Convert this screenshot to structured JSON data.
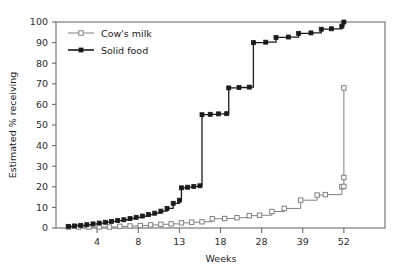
{
  "chart_data": {
    "type": "line",
    "title": "",
    "subtitle": "",
    "xlabel": "Weeks",
    "ylabel": "Estimated % receiving",
    "xlim": [
      0,
      8
    ],
    "ylim": [
      0,
      100
    ],
    "grid": false,
    "step": "post",
    "legend_position": "top-left",
    "x_tick_labels": [
      "4",
      "8",
      "13",
      "18",
      "28",
      "39",
      "52"
    ],
    "x_tick_positions": [
      1,
      2,
      3,
      4,
      5,
      6,
      7
    ],
    "y_tick_labels": [
      "0",
      "10",
      "20",
      "30",
      "40",
      "50",
      "60",
      "70",
      "80",
      "90",
      "100"
    ],
    "y_tick_values": [
      0,
      10,
      20,
      30,
      40,
      50,
      60,
      70,
      80,
      90,
      100
    ],
    "series": [
      {
        "name": "Cow's milk",
        "marker": "open-square",
        "color": "#808080",
        "points": [
          {
            "x": 0.3,
            "y": 0.5
          },
          {
            "x": 0.55,
            "y": 0.5
          },
          {
            "x": 0.8,
            "y": 0.5
          },
          {
            "x": 1.05,
            "y": 0.5
          },
          {
            "x": 1.3,
            "y": 0.5
          },
          {
            "x": 1.55,
            "y": 0.8
          },
          {
            "x": 1.8,
            "y": 1.0
          },
          {
            "x": 2.05,
            "y": 1.2
          },
          {
            "x": 2.3,
            "y": 1.5
          },
          {
            "x": 2.55,
            "y": 1.8
          },
          {
            "x": 2.8,
            "y": 2.0
          },
          {
            "x": 3.05,
            "y": 2.5
          },
          {
            "x": 3.3,
            "y": 2.8
          },
          {
            "x": 3.55,
            "y": 3.0
          },
          {
            "x": 3.8,
            "y": 4.5
          },
          {
            "x": 4.1,
            "y": 4.6
          },
          {
            "x": 4.4,
            "y": 5.0
          },
          {
            "x": 4.7,
            "y": 6.0
          },
          {
            "x": 4.95,
            "y": 6.2
          },
          {
            "x": 5.25,
            "y": 8.0
          },
          {
            "x": 5.55,
            "y": 9.5
          },
          {
            "x": 5.95,
            "y": 13.5
          },
          {
            "x": 6.35,
            "y": 16.0
          },
          {
            "x": 6.55,
            "y": 16.2
          },
          {
            "x": 6.95,
            "y": 20.0
          },
          {
            "x": 7.0,
            "y": 20.2
          },
          {
            "x": 7.0,
            "y": 24.5
          },
          {
            "x": 7.0,
            "y": 68.0
          }
        ]
      },
      {
        "name": "Solid food",
        "marker": "filled-square",
        "color": "#1a1a1a",
        "points": [
          {
            "x": 0.3,
            "y": 0.8
          },
          {
            "x": 0.45,
            "y": 1.0
          },
          {
            "x": 0.6,
            "y": 1.3
          },
          {
            "x": 0.75,
            "y": 1.6
          },
          {
            "x": 0.9,
            "y": 2.0
          },
          {
            "x": 1.05,
            "y": 2.4
          },
          {
            "x": 1.2,
            "y": 2.8
          },
          {
            "x": 1.35,
            "y": 3.2
          },
          {
            "x": 1.5,
            "y": 3.6
          },
          {
            "x": 1.65,
            "y": 4.0
          },
          {
            "x": 1.8,
            "y": 4.6
          },
          {
            "x": 1.95,
            "y": 5.2
          },
          {
            "x": 2.1,
            "y": 5.8
          },
          {
            "x": 2.25,
            "y": 6.5
          },
          {
            "x": 2.4,
            "y": 7.2
          },
          {
            "x": 2.55,
            "y": 8.2
          },
          {
            "x": 2.7,
            "y": 9.5
          },
          {
            "x": 2.85,
            "y": 12.0
          },
          {
            "x": 3.0,
            "y": 13.5
          },
          {
            "x": 3.05,
            "y": 19.5
          },
          {
            "x": 3.2,
            "y": 19.8
          },
          {
            "x": 3.35,
            "y": 20.2
          },
          {
            "x": 3.5,
            "y": 20.5
          },
          {
            "x": 3.55,
            "y": 55.0
          },
          {
            "x": 3.75,
            "y": 55.2
          },
          {
            "x": 3.95,
            "y": 55.4
          },
          {
            "x": 4.15,
            "y": 55.5
          },
          {
            "x": 4.2,
            "y": 68.0
          },
          {
            "x": 4.45,
            "y": 68.2
          },
          {
            "x": 4.7,
            "y": 68.4
          },
          {
            "x": 4.8,
            "y": 90.0
          },
          {
            "x": 5.1,
            "y": 90.2
          },
          {
            "x": 5.35,
            "y": 92.5
          },
          {
            "x": 5.65,
            "y": 92.7
          },
          {
            "x": 5.9,
            "y": 94.5
          },
          {
            "x": 6.2,
            "y": 94.7
          },
          {
            "x": 6.45,
            "y": 96.5
          },
          {
            "x": 6.7,
            "y": 96.7
          },
          {
            "x": 6.95,
            "y": 98.0
          },
          {
            "x": 7.0,
            "y": 100.0
          }
        ]
      }
    ],
    "legend": [
      {
        "label": "Cow's milk",
        "marker": "open-square",
        "color": "#808080"
      },
      {
        "label": "Solid food",
        "marker": "filled-square",
        "color": "#1a1a1a"
      }
    ]
  }
}
